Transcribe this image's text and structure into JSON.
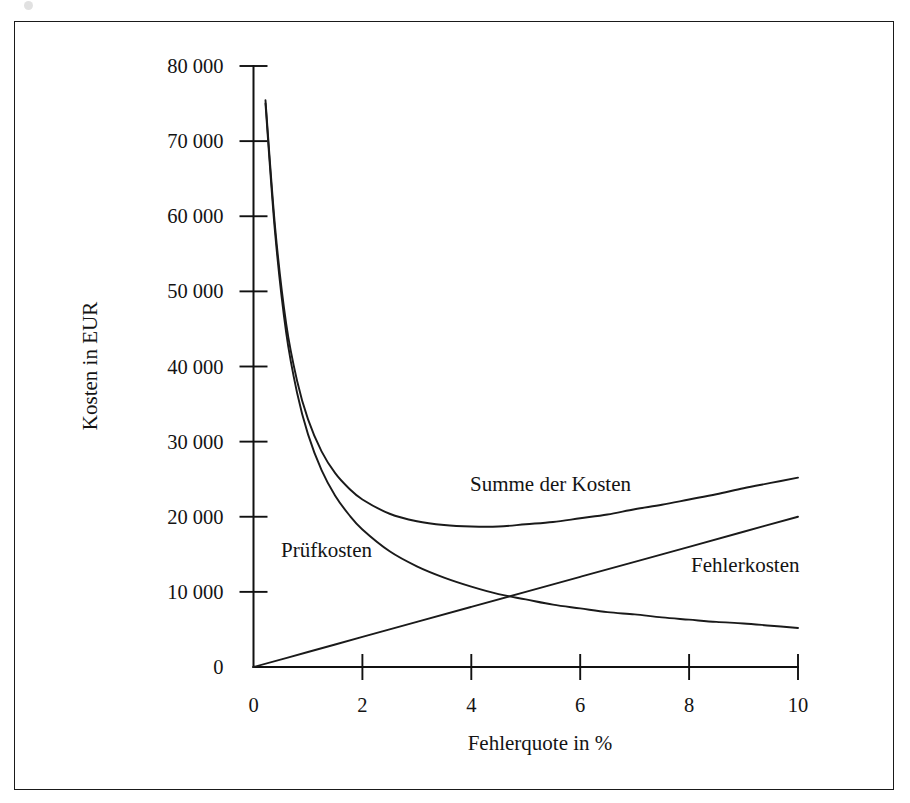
{
  "figure": {
    "background_color": "#ffffff",
    "line_color": "#1a1a1a",
    "frame_color": "#1a1a1a"
  },
  "chart_data": {
    "type": "line",
    "title": "",
    "xlabel": "Fehlerquote in %",
    "ylabel": "Kosten in EUR",
    "xlim": [
      0,
      10
    ],
    "ylim": [
      0,
      80000
    ],
    "xticks": [
      0,
      2,
      4,
      6,
      8,
      10
    ],
    "xticklabels": [
      "0",
      "2",
      "4",
      "6",
      "8",
      "10"
    ],
    "yticks": [
      0,
      10000,
      20000,
      30000,
      40000,
      50000,
      60000,
      70000,
      80000
    ],
    "yticklabels": [
      "0",
      "10 000",
      "20 000",
      "30 000",
      "40 000",
      "50 000",
      "60 000",
      "70 000",
      "80 000"
    ],
    "grid": false,
    "legend_position": "inline-annotations",
    "annotations": [
      {
        "text": "Summe der Kosten",
        "x": 4.9,
        "y": 23000
      },
      {
        "text": "Prüfkosten",
        "x": 1.1,
        "y": 14300
      },
      {
        "text": "Fehlerkosten",
        "x": 8.3,
        "y": 12200
      }
    ],
    "series": [
      {
        "name": "Prüfkosten",
        "x": [
          0.22,
          0.4,
          0.6,
          0.8,
          1.0,
          1.25,
          1.5,
          1.75,
          2.0,
          2.5,
          3.0,
          3.5,
          4.0,
          4.5,
          5.0,
          5.5,
          6.0,
          6.5,
          7.0,
          7.5,
          8.0,
          8.5,
          9.0,
          9.5,
          10.0
        ],
        "y": [
          75000,
          57500,
          44500,
          36500,
          31000,
          26200,
          22800,
          20300,
          18300,
          15400,
          13400,
          11900,
          10700,
          9700,
          9000,
          8300,
          7800,
          7300,
          7000,
          6600,
          6300,
          6000,
          5800,
          5500,
          5200
        ]
      },
      {
        "name": "Fehlerkosten",
        "x": [
          0,
          1,
          2,
          3,
          4,
          5,
          6,
          7,
          8,
          9,
          10
        ],
        "y": [
          0,
          2000,
          4000,
          6000,
          8000,
          10000,
          12000,
          14000,
          16000,
          18000,
          20000
        ]
      },
      {
        "name": "Summe der Kosten",
        "x": [
          0.22,
          0.4,
          0.6,
          0.8,
          1.0,
          1.25,
          1.5,
          1.75,
          2.0,
          2.5,
          3.0,
          3.5,
          4.0,
          4.5,
          5.0,
          5.5,
          6.0,
          6.5,
          7.0,
          7.5,
          8.0,
          8.5,
          9.0,
          9.5,
          10.0
        ],
        "y": [
          75440,
          58300,
          45700,
          38100,
          33000,
          28700,
          25800,
          23800,
          22300,
          20400,
          19400,
          18900,
          18700,
          18700,
          19000,
          19300,
          19800,
          20300,
          21000,
          21600,
          22300,
          23000,
          23800,
          24500,
          25200
        ]
      }
    ]
  }
}
